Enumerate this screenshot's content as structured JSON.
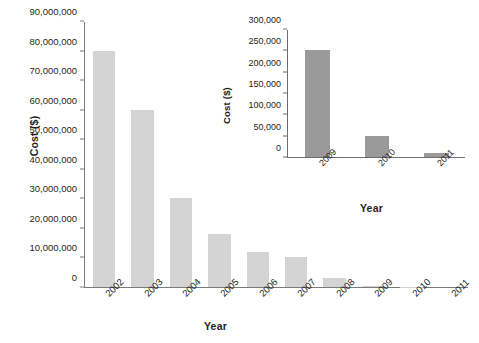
{
  "chart_data": [
    {
      "id": "main",
      "type": "bar",
      "title": "",
      "xlabel": "Year",
      "ylabel": "Cost ($)",
      "categories": [
        "2002",
        "2003",
        "2004",
        "2005",
        "2006",
        "2007",
        "2008",
        "2009",
        "2010",
        "2011"
      ],
      "values": [
        80000000,
        60000000,
        30000000,
        18000000,
        12000000,
        10000000,
        3000000,
        250000,
        50000,
        10000
      ],
      "ylim": [
        0,
        90000000
      ],
      "ytick_labels": [
        "0",
        "10,000,000",
        "20,000,000",
        "30,000,000",
        "40,000,000",
        "50,000,000",
        "60,000,000",
        "70,000,000",
        "80,000,000",
        "90,000,000"
      ],
      "ytick_values": [
        0,
        10000000,
        20000000,
        30000000,
        40000000,
        50000000,
        60000000,
        70000000,
        80000000,
        90000000
      ],
      "grid": false,
      "legend": false,
      "bar_color": "#d4d4d4"
    },
    {
      "id": "inset",
      "type": "bar",
      "title": "",
      "xlabel": "Year",
      "ylabel": "Cost ($)",
      "categories": [
        "2009",
        "2010",
        "2011"
      ],
      "values": [
        250000,
        50000,
        10000
      ],
      "ylim": [
        0,
        300000
      ],
      "ytick_labels": [
        "0",
        "50,000",
        "100,000",
        "150,000",
        "200,000",
        "250,000",
        "300,000"
      ],
      "ytick_values": [
        0,
        50000,
        100000,
        150000,
        200000,
        250000,
        300000
      ],
      "grid": false,
      "legend": false,
      "bar_color": "#9a9a9a"
    }
  ]
}
